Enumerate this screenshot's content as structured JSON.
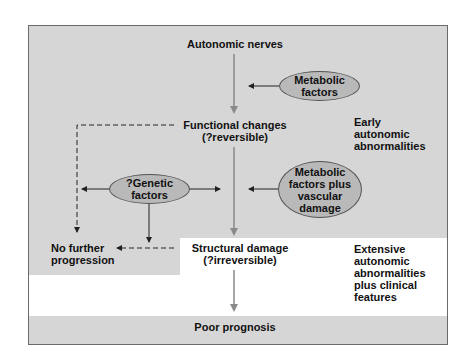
{
  "diagram": {
    "nodes": {
      "autonomic_nerves": "Autonomic nerves",
      "functional_changes": [
        "Functional changes",
        "(?reversible)"
      ],
      "structural_damage": [
        "Structural damage",
        "(?irreversible)"
      ],
      "poor_prognosis": "Poor prognosis",
      "no_further_progression": [
        "No further",
        "progression"
      ]
    },
    "factors": {
      "metabolic": [
        "Metabolic",
        "factors"
      ],
      "metabolic_vascular": [
        "Metabolic",
        "factors plus",
        "vascular",
        "damage"
      ],
      "genetic": [
        "?Genetic",
        "factors"
      ]
    },
    "stages": {
      "early": [
        "Early",
        "autonomic",
        "abnormalities"
      ],
      "extensive": [
        "Extensive",
        "autonomic",
        "abnormalities",
        "plus clinical",
        "features"
      ]
    },
    "colors": {
      "panel_gray": "#d6d6d6",
      "oval_fill": "#b9b9b9",
      "main_arrow": "#8a8a8a",
      "side_arrow": "#222222"
    }
  }
}
